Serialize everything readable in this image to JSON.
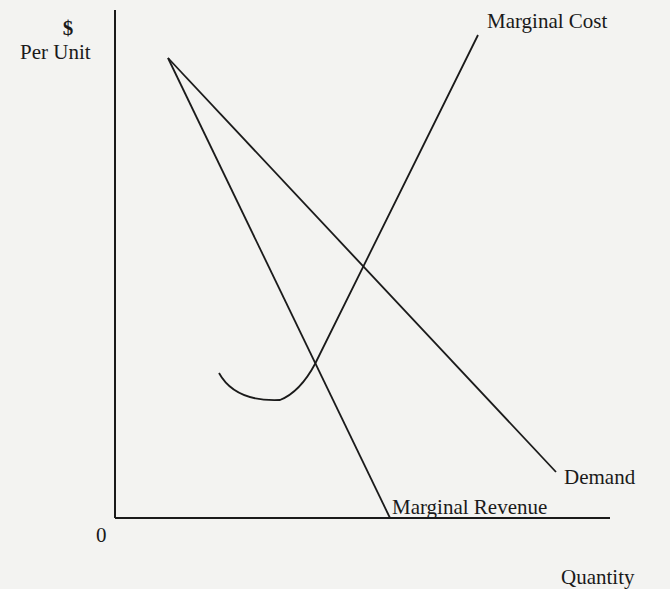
{
  "diagram": {
    "y_axis": {
      "symbol": "$",
      "label": "Per Unit"
    },
    "x_axis": {
      "label": "Quantity",
      "origin": "0"
    },
    "curves": {
      "marginal_cost": "Marginal Cost",
      "demand": "Demand",
      "marginal_revenue": "Marginal Revenue"
    },
    "colors": {
      "line": "#1a1a1a",
      "background": "#f3f3f1"
    }
  }
}
